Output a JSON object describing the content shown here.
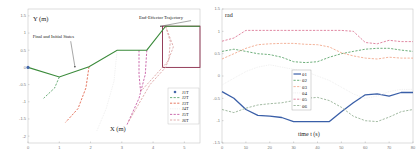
{
  "chart_data": [
    {
      "type": "line",
      "title": "",
      "xlabel": "X (m)",
      "ylabel": "Y (m)",
      "xlim": [
        0,
        5.5
      ],
      "ylim": [
        -2.2,
        1.7
      ],
      "xticks": [
        0,
        1,
        2,
        3,
        4,
        5
      ],
      "yticks": [
        1.5,
        1,
        0.5,
        0,
        -0.5,
        -1,
        -1.5,
        -2
      ],
      "annotations": [
        {
          "text": "End-Effector Trajectory",
          "x": 3.55,
          "y": 1.42,
          "arrow_to": [
            4.25,
            1.2
          ]
        },
        {
          "text": "Final and Initial States",
          "x": 0.15,
          "y": 0.85,
          "arrow_to": [
            1.5,
            0.02
          ]
        }
      ],
      "arm_configuration": {
        "name": "arm",
        "color": "#3a8a3a",
        "points": [
          [
            0,
            0
          ],
          [
            1,
            -0.28
          ],
          [
            1.95,
            0.02
          ],
          [
            2.85,
            0.5
          ],
          [
            3.8,
            0.5
          ],
          [
            4.4,
            1.2
          ],
          [
            5.5,
            1.2
          ]
        ]
      },
      "workspace_box": {
        "x0": 4.3,
        "x1": 5.5,
        "y0": 0,
        "y1": 1.2,
        "color": "#8b2c4a"
      },
      "series": [
        {
          "name": "J1T",
          "style": "marker",
          "color": "#4466aa",
          "points": [
            [
              0,
              0
            ]
          ]
        },
        {
          "name": "J2T",
          "style": "dashed",
          "color": "#4a9a5a",
          "points": [
            [
              1,
              -0.28
            ],
            [
              0.85,
              -0.6
            ],
            [
              0.5,
              -0.9
            ]
          ]
        },
        {
          "name": "J3T",
          "style": "dashed",
          "color": "#e0553a",
          "points": [
            [
              1.95,
              0.02
            ],
            [
              1.85,
              -0.6
            ],
            [
              1.6,
              -1.2
            ],
            [
              1.2,
              -1.6
            ]
          ]
        },
        {
          "name": "J4T",
          "style": "dotted",
          "color": "#e8e8e8",
          "points": [
            [
              2.85,
              0.5
            ],
            [
              2.75,
              -0.4
            ],
            [
              2.5,
              -1.2
            ],
            [
              2.2,
              -1.85
            ]
          ]
        },
        {
          "name": "J5T",
          "style": "dashed",
          "color": "#c04a9a",
          "points": [
            [
              3.8,
              0.5
            ],
            [
              3.75,
              -0.2
            ],
            [
              3.55,
              -0.9
            ],
            [
              3.15,
              -1.7
            ]
          ]
        },
        {
          "name": "J6T",
          "style": "dashed",
          "color": "#d89a9a",
          "points": [
            [
              4.4,
              1.2
            ],
            [
              4.65,
              0.6
            ],
            [
              4.4,
              0
            ],
            [
              3.9,
              -0.5
            ],
            [
              3.2,
              -1.6
            ]
          ]
        }
      ],
      "extra_traces": [
        {
          "name": "J5T-b",
          "style": "dashed",
          "color": "#c04a9a",
          "points": [
            [
              3.55,
              0.5
            ],
            [
              3.55,
              -0.2
            ],
            [
              3.6,
              -0.7
            ]
          ]
        },
        {
          "name": "J6T-b",
          "style": "dashed",
          "color": "#d89a9a",
          "points": [
            [
              4.4,
              1.2
            ],
            [
              4.55,
              0.75
            ],
            [
              4.5,
              0.2
            ],
            [
              4.1,
              -0.2
            ],
            [
              3.6,
              -0.7
            ]
          ]
        }
      ],
      "legend": {
        "position": "lower right",
        "entries": [
          "J1T",
          "J2T",
          "J3T",
          "J4T",
          "J5T",
          "J6T"
        ]
      }
    },
    {
      "type": "line",
      "title": "",
      "xlabel": "time t (s)",
      "ylabel": "rad",
      "xlim": [
        0,
        80
      ],
      "ylim": [
        -1.5,
        1.5
      ],
      "xticks": [
        0,
        10,
        20,
        30,
        40,
        50,
        60,
        70,
        80
      ],
      "yticks": [
        1.5,
        1,
        0.5,
        0,
        -0.5,
        -1,
        -1.5
      ],
      "x": [
        0,
        5,
        10,
        15,
        20,
        25,
        30,
        35,
        40,
        45,
        50,
        55,
        60,
        65,
        70,
        75,
        80
      ],
      "series": [
        {
          "name": "θ1",
          "style": "solid",
          "color": "#3a5fa8",
          "values": [
            -0.35,
            -0.5,
            -0.75,
            -0.88,
            -0.9,
            -0.93,
            -1.02,
            -1.02,
            -1.02,
            -1.02,
            -0.8,
            -0.6,
            -0.42,
            -0.4,
            -0.45,
            -0.37,
            -0.37
          ]
        },
        {
          "name": "θ2",
          "style": "dashed",
          "color": "#4a9a5a",
          "values": [
            0.55,
            0.6,
            0.55,
            0.5,
            0.48,
            0.42,
            0.32,
            0.3,
            0.32,
            0.42,
            0.5,
            0.55,
            0.6,
            0.62,
            0.62,
            0.58,
            0.55
          ]
        },
        {
          "name": "θ3",
          "style": "dashed",
          "color": "#f0a080",
          "values": [
            0.38,
            0.5,
            0.62,
            0.7,
            0.72,
            0.73,
            0.73,
            0.71,
            0.7,
            0.65,
            0.52,
            0.45,
            0.4,
            0.38,
            0.42,
            0.4,
            0.4
          ]
        },
        {
          "name": "θ4",
          "style": "dotted",
          "color": "#e8e8e8",
          "values": [
            -0.2,
            -0.05,
            0.1,
            0.2,
            0.25,
            0.2,
            0.15,
            0.1,
            0.0,
            -0.1,
            -0.25,
            -0.4,
            -0.5,
            -0.45,
            -0.35,
            -0.3,
            -0.3
          ]
        },
        {
          "name": "θ5",
          "style": "dashed",
          "color": "#d86a8a",
          "values": [
            0.78,
            0.85,
            1.02,
            1.02,
            1.02,
            1.02,
            1.02,
            1.02,
            1.02,
            1.02,
            1.02,
            1.0,
            0.75,
            0.72,
            0.8,
            0.77,
            0.77
          ]
        },
        {
          "name": "θ6",
          "style": "dashed",
          "color": "#8aa88a",
          "values": [
            -0.75,
            -0.82,
            -0.72,
            -0.65,
            -0.62,
            -0.6,
            -0.55,
            -0.5,
            -0.48,
            -0.55,
            -0.7,
            -0.9,
            -1.0,
            -1.02,
            -0.92,
            -0.8,
            -0.75
          ]
        }
      ],
      "legend": {
        "position": "center",
        "entries": [
          "θ1",
          "θ2",
          "θ3",
          "θ4",
          "θ5",
          "θ6"
        ]
      }
    }
  ]
}
